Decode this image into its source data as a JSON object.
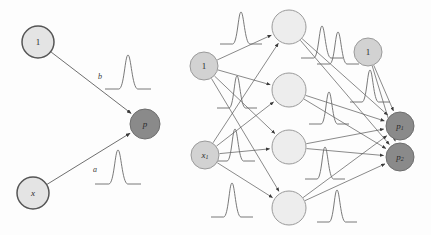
{
  "figure": {
    "type": "neural-network-diagram",
    "background_color": "#fdfdfd",
    "title": "",
    "panels": [
      {
        "id": "left",
        "caption": "",
        "description": "single-output perceptron with bias"
      },
      {
        "id": "right",
        "caption": "",
        "description": "two-layer network with four hidden units and two outputs"
      }
    ]
  },
  "colors": {
    "node_input_fill": "#e4e4e4",
    "node_input_stroke": "#555555",
    "node_hidden_fill": "#ededed",
    "node_hidden_stroke": "#9a9a9a",
    "node_output_fill": "#8a8a8a",
    "node_output_stroke": "#6e6e6e",
    "node_bias_fill": "#d2d2d2",
    "node_bias_stroke": "#9a9a9a",
    "edge": "#4a4a4a",
    "curve": "#6a6a6a",
    "label_text": "#2b2b2b"
  },
  "left_panel": {
    "nodes": [
      {
        "name": "bias-node",
        "label": "1",
        "sub": "",
        "cx": 38,
        "cy": 42,
        "r": 16,
        "kind": "input",
        "italic": false
      },
      {
        "name": "input-node-x",
        "label": "x",
        "sub": "",
        "cx": 33,
        "cy": 193,
        "r": 16,
        "kind": "input",
        "italic": true
      },
      {
        "name": "output-node-p",
        "label": "p",
        "sub": "",
        "cx": 145,
        "cy": 124,
        "r": 15,
        "kind": "output",
        "italic": true
      }
    ],
    "edges": [
      {
        "name": "edge-bias-to-p",
        "label": "b",
        "from": "bias-node",
        "to": "output-node-p",
        "label_x": 100,
        "label_y": 77
      },
      {
        "name": "edge-x-to-p",
        "label": "a",
        "from": "input-node-x",
        "to": "output-node-p",
        "label_x": 95,
        "label_y": 170
      }
    ],
    "curves": [
      {
        "name": "weight-distribution-b",
        "cx": 128,
        "cy": 72,
        "w": 46,
        "h": 34
      },
      {
        "name": "weight-distribution-a",
        "cx": 118,
        "cy": 167,
        "w": 46,
        "h": 34
      }
    ]
  },
  "right_panel": {
    "nodes": [
      {
        "name": "bias-node-input-layer",
        "label": "1",
        "sub": "",
        "cx": 204,
        "cy": 66,
        "r": 14,
        "kind": "bias",
        "italic": false
      },
      {
        "name": "input-node-x1",
        "label": "x",
        "sub": "1",
        "cx": 205,
        "cy": 155,
        "r": 14,
        "kind": "bias",
        "italic": true
      },
      {
        "name": "hidden-node-1",
        "label": "",
        "sub": "",
        "cx": 289,
        "cy": 27,
        "r": 17,
        "kind": "hidden",
        "italic": false
      },
      {
        "name": "hidden-node-2",
        "label": "",
        "sub": "",
        "cx": 289,
        "cy": 90,
        "r": 17,
        "kind": "hidden",
        "italic": false
      },
      {
        "name": "hidden-node-3",
        "label": "",
        "sub": "",
        "cx": 289,
        "cy": 147,
        "r": 17,
        "kind": "hidden",
        "italic": false
      },
      {
        "name": "hidden-node-4",
        "label": "",
        "sub": "",
        "cx": 289,
        "cy": 208,
        "r": 17,
        "kind": "hidden",
        "italic": false
      },
      {
        "name": "bias-node-output-layer",
        "label": "1",
        "sub": "",
        "cx": 368,
        "cy": 52,
        "r": 14,
        "kind": "bias",
        "italic": false
      },
      {
        "name": "output-node-p1",
        "label": "p",
        "sub": "1",
        "cx": 400,
        "cy": 126,
        "r": 14,
        "kind": "output",
        "italic": true
      },
      {
        "name": "output-node-p2",
        "label": "p",
        "sub": "2",
        "cx": 400,
        "cy": 157,
        "r": 14,
        "kind": "output",
        "italic": true
      }
    ],
    "edges": [
      {
        "name": "edge-bias-h1",
        "from": "bias-node-input-layer",
        "to": "hidden-node-1"
      },
      {
        "name": "edge-bias-h2",
        "from": "bias-node-input-layer",
        "to": "hidden-node-2"
      },
      {
        "name": "edge-bias-h3",
        "from": "bias-node-input-layer",
        "to": "hidden-node-3"
      },
      {
        "name": "edge-bias-h4",
        "from": "bias-node-input-layer",
        "to": "hidden-node-4"
      },
      {
        "name": "edge-x1-h1",
        "from": "input-node-x1",
        "to": "hidden-node-1"
      },
      {
        "name": "edge-x1-h2",
        "from": "input-node-x1",
        "to": "hidden-node-2"
      },
      {
        "name": "edge-x1-h3",
        "from": "input-node-x1",
        "to": "hidden-node-3"
      },
      {
        "name": "edge-x1-h4",
        "from": "input-node-x1",
        "to": "hidden-node-4"
      },
      {
        "name": "edge-h1-p1",
        "from": "hidden-node-1",
        "to": "output-node-p1"
      },
      {
        "name": "edge-h1-p2",
        "from": "hidden-node-1",
        "to": "output-node-p2"
      },
      {
        "name": "edge-h2-p1",
        "from": "hidden-node-2",
        "to": "output-node-p1"
      },
      {
        "name": "edge-h2-p2",
        "from": "hidden-node-2",
        "to": "output-node-p2"
      },
      {
        "name": "edge-h3-p1",
        "from": "hidden-node-3",
        "to": "output-node-p1"
      },
      {
        "name": "edge-h3-p2",
        "from": "hidden-node-3",
        "to": "output-node-p2"
      },
      {
        "name": "edge-h4-p1",
        "from": "hidden-node-4",
        "to": "output-node-p1"
      },
      {
        "name": "edge-h4-p2",
        "from": "hidden-node-4",
        "to": "output-node-p2"
      },
      {
        "name": "edge-bias2-p1",
        "from": "bias-node-output-layer",
        "to": "output-node-p1"
      },
      {
        "name": "edge-bias2-p2",
        "from": "bias-node-output-layer",
        "to": "output-node-p2"
      }
    ],
    "curves": [
      {
        "name": "weight-distribution-r1",
        "cx": 241,
        "cy": 28,
        "w": 42,
        "h": 32
      },
      {
        "name": "weight-distribution-r2",
        "cx": 237,
        "cy": 92,
        "w": 40,
        "h": 32
      },
      {
        "name": "weight-distribution-r3",
        "cx": 235,
        "cy": 145,
        "w": 40,
        "h": 32
      },
      {
        "name": "weight-distribution-r4",
        "cx": 232,
        "cy": 200,
        "w": 42,
        "h": 34
      },
      {
        "name": "weight-distribution-r5",
        "cx": 322,
        "cy": 42,
        "w": 42,
        "h": 32
      },
      {
        "name": "weight-distribution-r6",
        "cx": 338,
        "cy": 48,
        "w": 42,
        "h": 32
      },
      {
        "name": "weight-distribution-r7",
        "cx": 329,
        "cy": 108,
        "w": 40,
        "h": 32
      },
      {
        "name": "weight-distribution-r8",
        "cx": 325,
        "cy": 163,
        "w": 40,
        "h": 32
      },
      {
        "name": "weight-distribution-r9",
        "cx": 337,
        "cy": 206,
        "w": 40,
        "h": 32
      },
      {
        "name": "weight-distribution-r10",
        "cx": 370,
        "cy": 86,
        "w": 40,
        "h": 32
      }
    ]
  }
}
